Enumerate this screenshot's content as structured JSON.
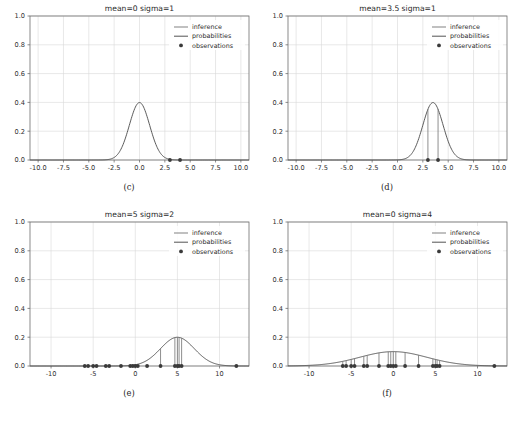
{
  "figure": {
    "width": 516,
    "height": 423,
    "background": "#ffffff",
    "rows": 2,
    "cols": 2
  },
  "style": {
    "inference_color": "#7a7a7a",
    "probabilities_color": "#4a4a4a",
    "observations_color": "#3a3a3a",
    "grid_color": "#d8d8d8",
    "axis_color": "#6e6e6e",
    "text_color": "#1f1f1f"
  },
  "legend": {
    "entries": [
      {
        "label": "inference",
        "marker": "line"
      },
      {
        "label": "probabilities",
        "marker": "line"
      },
      {
        "label": "observations",
        "marker": "dot"
      }
    ]
  },
  "captions": {
    "c": "(c)",
    "d": "(d)",
    "e": "(e)",
    "f": "(f)"
  },
  "chart_data": [
    {
      "id": "c",
      "type": "line",
      "title": "mean=0 sigma=1",
      "caption": "(c)",
      "xlabel": "",
      "ylabel": "",
      "xlim": [
        -10.8,
        10.8
      ],
      "ylim": [
        0.0,
        1.0
      ],
      "xticks": [
        -10.0,
        -7.5,
        -5.0,
        -2.5,
        0.0,
        2.5,
        5.0,
        7.5,
        10.0
      ],
      "xticklabels": [
        "-10.0",
        "-7.5",
        "-5.0",
        "-2.5",
        "0.0",
        "2.5",
        "5.0",
        "7.5",
        "10.0"
      ],
      "yticks": [
        0.0,
        0.2,
        0.4,
        0.6,
        0.8,
        1.0
      ],
      "yticklabels": [
        "0.0",
        "0.2",
        "0.4",
        "0.6",
        "0.8",
        "1.0"
      ],
      "grid": true,
      "legend_position": "upper right",
      "mean": 0,
      "sigma": 1,
      "peak": 0.3989,
      "observations": [
        3.0,
        4.0
      ],
      "inference_lines": [],
      "series": [
        {
          "name": "probabilities",
          "kind": "gaussian",
          "mean": 0,
          "sigma": 1
        },
        {
          "name": "inference",
          "kind": "vlines",
          "values": []
        },
        {
          "name": "observations",
          "kind": "scatter",
          "values": [
            3.0,
            4.0
          ]
        }
      ]
    },
    {
      "id": "d",
      "type": "line",
      "title": "mean=3.5 sigma=1",
      "caption": "(d)",
      "xlabel": "",
      "ylabel": "",
      "xlim": [
        -10.8,
        10.8
      ],
      "ylim": [
        0.0,
        1.0
      ],
      "xticks": [
        -10.0,
        -7.5,
        -5.0,
        -2.5,
        0.0,
        2.5,
        5.0,
        7.5,
        10.0
      ],
      "xticklabels": [
        "-10.0",
        "-7.5",
        "-5.0",
        "-2.5",
        "0.0",
        "2.5",
        "5.0",
        "7.5",
        "10.0"
      ],
      "yticks": [
        0.0,
        0.2,
        0.4,
        0.6,
        0.8,
        1.0
      ],
      "yticklabels": [
        "0.0",
        "0.2",
        "0.4",
        "0.6",
        "0.8",
        "1.0"
      ],
      "grid": true,
      "legend_position": "upper right",
      "mean": 3.5,
      "sigma": 1,
      "peak": 0.3989,
      "observations": [
        3.0,
        4.0
      ],
      "inference_lines": [
        3.0,
        4.0
      ],
      "series": [
        {
          "name": "probabilities",
          "kind": "gaussian",
          "mean": 3.5,
          "sigma": 1
        },
        {
          "name": "inference",
          "kind": "vlines",
          "values": [
            3.0,
            4.0
          ]
        },
        {
          "name": "observations",
          "kind": "scatter",
          "values": [
            3.0,
            4.0
          ]
        }
      ]
    },
    {
      "id": "e",
      "type": "line",
      "title": "mean=5 sigma=2",
      "caption": "(e)",
      "xlabel": "",
      "ylabel": "",
      "xlim": [
        -12.5,
        13.5
      ],
      "ylim": [
        0.0,
        1.0
      ],
      "xticks": [
        -10,
        -5,
        0,
        5,
        10
      ],
      "xticklabels": [
        "-10",
        "-5",
        "0",
        "5",
        "10"
      ],
      "yticks": [
        0.0,
        0.2,
        0.4,
        0.6,
        0.8,
        1.0
      ],
      "yticklabels": [
        "0.0",
        "0.2",
        "0.4",
        "0.6",
        "0.8",
        "1.0"
      ],
      "grid": true,
      "legend_position": "upper right",
      "mean": 5,
      "sigma": 2,
      "peak": 0.1995,
      "observations": [
        -6.0,
        -5.6,
        -5.0,
        -4.6,
        -3.5,
        -3.1,
        -1.7,
        -0.6,
        -0.3,
        0.0,
        0.3,
        1.4,
        3.0,
        4.7,
        5.0,
        5.2,
        5.5,
        12.0
      ],
      "inference_lines": [
        3.0,
        4.7,
        5.0,
        5.2,
        5.5
      ],
      "series": [
        {
          "name": "probabilities",
          "kind": "gaussian",
          "mean": 5,
          "sigma": 2
        },
        {
          "name": "inference",
          "kind": "vlines",
          "values": [
            3.0,
            4.7,
            5.0,
            5.2,
            5.5
          ]
        },
        {
          "name": "observations",
          "kind": "scatter",
          "values": [
            -6.0,
            -5.6,
            -5.0,
            -4.6,
            -3.5,
            -3.1,
            -1.7,
            -0.6,
            -0.3,
            0.0,
            0.3,
            1.4,
            3.0,
            4.7,
            5.0,
            5.2,
            5.5,
            12.0
          ]
        }
      ]
    },
    {
      "id": "f",
      "type": "line",
      "title": "mean=0 sigma=4",
      "caption": "(f)",
      "xlabel": "",
      "ylabel": "",
      "xlim": [
        -12.5,
        13.5
      ],
      "ylim": [
        0.0,
        1.0
      ],
      "xticks": [
        -10,
        -5,
        0,
        5,
        10
      ],
      "xticklabels": [
        "-10",
        "-5",
        "0",
        "5",
        "10"
      ],
      "yticks": [
        0.0,
        0.2,
        0.4,
        0.6,
        0.8,
        1.0
      ],
      "yticklabels": [
        "0.0",
        "0.2",
        "0.4",
        "0.6",
        "0.8",
        "1.0"
      ],
      "grid": true,
      "legend_position": "upper right",
      "mean": 0,
      "sigma": 4,
      "peak": 0.0997,
      "observations": [
        -6.0,
        -5.6,
        -5.0,
        -4.6,
        -3.5,
        -3.1,
        -1.7,
        -0.6,
        -0.3,
        0.0,
        0.3,
        1.4,
        3.0,
        4.7,
        5.0,
        5.2,
        5.5,
        12.0
      ],
      "inference_lines": [
        -6.0,
        -5.6,
        -5.0,
        -4.6,
        -3.5,
        -3.1,
        -1.7,
        -0.6,
        -0.3,
        0.0,
        0.3,
        1.4,
        3.0,
        4.7,
        5.0,
        5.2,
        5.5
      ],
      "series": [
        {
          "name": "probabilities",
          "kind": "gaussian",
          "mean": 0,
          "sigma": 4
        },
        {
          "name": "inference",
          "kind": "vlines",
          "values": [
            -6.0,
            -5.6,
            -5.0,
            -4.6,
            -3.5,
            -3.1,
            -1.7,
            -0.6,
            -0.3,
            0.0,
            0.3,
            1.4,
            3.0,
            4.7,
            5.0,
            5.2,
            5.5
          ]
        },
        {
          "name": "observations",
          "kind": "scatter",
          "values": [
            -6.0,
            -5.6,
            -5.0,
            -4.6,
            -3.5,
            -3.1,
            -1.7,
            -0.6,
            -0.3,
            0.0,
            0.3,
            1.4,
            3.0,
            4.7,
            5.0,
            5.2,
            5.5,
            12.0
          ]
        }
      ]
    }
  ]
}
